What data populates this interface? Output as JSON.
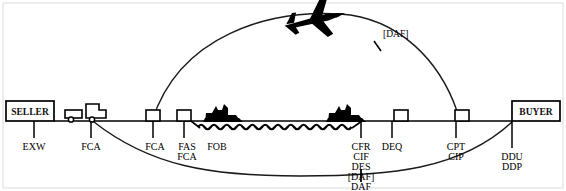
{
  "diagram": {
    "type": "incoterms-flow",
    "background_color": "#ffffff",
    "line_color": "#000000",
    "frame": {
      "visible": true,
      "color": "#d8d8d8"
    },
    "endpoints": {
      "origin": {
        "name": "seller-box",
        "label": "SELLER",
        "x": 6,
        "y": 101,
        "width": 48,
        "height": 20
      },
      "destination": {
        "name": "buyer-box",
        "label": "BUYER",
        "x": 512,
        "y": 101,
        "width": 48,
        "height": 20
      }
    },
    "ground_line": {
      "y": 121,
      "x_start": 54,
      "x_end": 512
    },
    "vehicles": [
      {
        "name": "truck-icon",
        "type": "truck",
        "x": 64,
        "y": 100
      },
      {
        "name": "ship-icon-departure",
        "type": "ship",
        "x": 207,
        "y": 104
      },
      {
        "name": "ship-icon-arrival",
        "type": "ship",
        "x": 330,
        "y": 104
      },
      {
        "name": "airplane-icon",
        "type": "airplane",
        "x": 290,
        "y": 18
      }
    ],
    "terminals": [
      {
        "name": "terminal-fca",
        "x": 146,
        "y": 110,
        "width": 14,
        "height": 11
      },
      {
        "name": "terminal-fas",
        "x": 177,
        "y": 110,
        "width": 14,
        "height": 11
      },
      {
        "name": "terminal-deq",
        "x": 394,
        "y": 110,
        "width": 14,
        "height": 11
      },
      {
        "name": "terminal-cpt",
        "x": 455,
        "y": 110,
        "width": 14,
        "height": 11
      }
    ],
    "water": {
      "name": "sea-waves",
      "x_start": 198,
      "x_end": 354,
      "y": 127
    },
    "tick_points": [
      {
        "name": "tick-exw",
        "x": 34,
        "terms": [
          "EXW"
        ],
        "label_y": 147
      },
      {
        "name": "tick-fca-premises",
        "x": 91,
        "terms": [
          "FCA"
        ],
        "label_y": 147
      },
      {
        "name": "tick-fca-terminal",
        "x": 153,
        "terms": [
          "FCA"
        ],
        "label_y": 147
      },
      {
        "name": "tick-fas-fca",
        "x": 184,
        "terms": [
          "FAS",
          "FCA"
        ],
        "label_y": 147
      },
      {
        "name": "tick-fob",
        "x": 215,
        "terms": [
          "FOB"
        ],
        "label_y": 147
      },
      {
        "name": "tick-cfr-cif-des-daf",
        "x": 361,
        "terms": [
          "CFR",
          "CIF",
          "DES",
          "[DAF]"
        ],
        "label_y": 147
      },
      {
        "name": "tick-deq",
        "x": 392,
        "terms": [
          "DEQ"
        ],
        "label_y": 147
      },
      {
        "name": "tick-cpt-cip",
        "x": 456,
        "terms": [
          "CPT",
          "CIP"
        ],
        "label_y": 147
      },
      {
        "name": "tick-ddu-ddp",
        "x": 512,
        "terms": [
          "DDU",
          "DDP"
        ],
        "label_y": 158
      }
    ],
    "air_route": {
      "name": "air-route-arc",
      "label": "[DAF]",
      "label_x": 383,
      "label_y": 34,
      "tick_x": 378,
      "tick_y": 46
    },
    "sea_route": {
      "name": "sea-route-arc",
      "label": "DAF",
      "label_x": 361,
      "label_y": 187,
      "tick_x": 361,
      "tick_y": 176
    },
    "all_terms": [
      "EXW",
      "FCA",
      "FAS",
      "FOB",
      "CFR",
      "CIF",
      "DES",
      "DEQ",
      "CPT",
      "CIP",
      "DAF",
      "DDU",
      "DDP"
    ]
  }
}
